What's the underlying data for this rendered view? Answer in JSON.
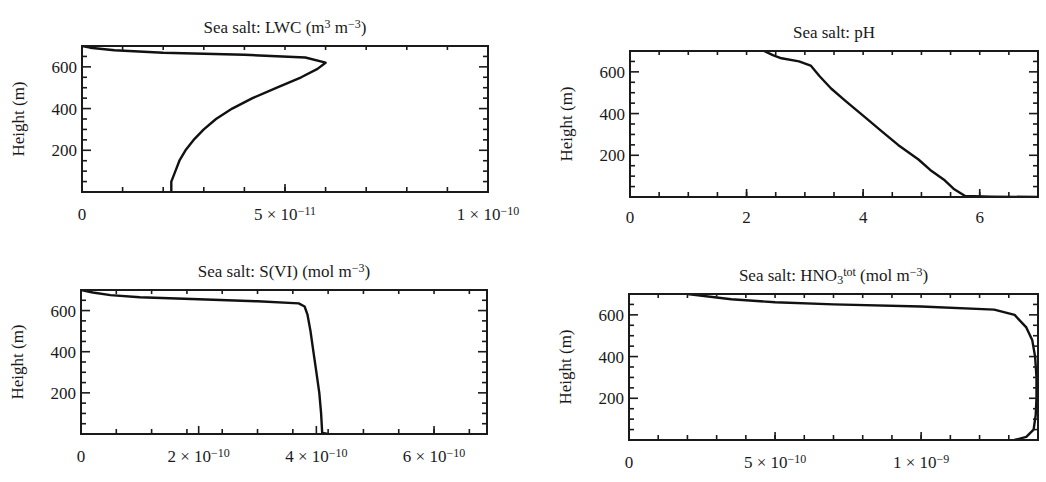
{
  "figure": {
    "panels": [
      {
        "id": "lwc",
        "title_parts": [
          [
            "Sea salt: LWC (m",
            ""
          ],
          [
            "3",
            "sup"
          ],
          [
            " m",
            ""
          ],
          [
            "−3",
            "sup"
          ],
          [
            ")",
            ""
          ]
        ],
        "title_text": "Sea salt: LWC (m3 m−3)",
        "ylabel": "Height (m)",
        "box": {
          "x0": 82,
          "y0": 46,
          "x1": 488,
          "y1": 192
        },
        "xlim": [
          0,
          1e-10
        ],
        "ylim": [
          0,
          700
        ],
        "xticks_major": [
          {
            "value": 0,
            "label": [
              [
                "0",
                ""
              ]
            ]
          },
          {
            "value": 5e-11,
            "label": [
              [
                "5 × 10",
                ""
              ],
              [
                "−11",
                "sup"
              ]
            ]
          },
          {
            "value": 1e-10,
            "label": [
              [
                "1 × 10",
                ""
              ],
              [
                "−10",
                "sup"
              ]
            ]
          }
        ],
        "xticks_minor_step": 1e-11,
        "yticks_major": [
          200,
          400,
          600
        ],
        "yticks_minor_step": 50,
        "tick_label_offset": 28
      },
      {
        "id": "ph",
        "title_parts": [
          [
            "Sea salt: pH",
            ""
          ]
        ],
        "title_text": "Sea salt: pH",
        "ylabel": "Height (m)",
        "box": {
          "x0": 630,
          "y0": 51,
          "x1": 1038,
          "y1": 197
        },
        "xlim": [
          0,
          7
        ],
        "ylim": [
          0,
          700
        ],
        "xticks_major": [
          {
            "value": 0,
            "label": [
              [
                "0",
                ""
              ]
            ]
          },
          {
            "value": 2,
            "label": [
              [
                "2",
                ""
              ]
            ]
          },
          {
            "value": 4,
            "label": [
              [
                "4",
                ""
              ]
            ]
          },
          {
            "value": 6,
            "label": [
              [
                "6",
                ""
              ]
            ]
          }
        ],
        "xticks_minor_step": 0.5,
        "yticks_major": [
          200,
          400,
          600
        ],
        "yticks_minor_step": 50,
        "tick_label_offset": 26
      },
      {
        "id": "svi",
        "title_parts": [
          [
            "Sea salt: S(VI) (mol m",
            ""
          ],
          [
            "−3",
            "sup"
          ],
          [
            ")",
            ""
          ]
        ],
        "title_text": "Sea salt: S(VI) (mol m−3)",
        "ylabel": "Height (m)",
        "box": {
          "x0": 81,
          "y0": 290,
          "x1": 487,
          "y1": 434
        },
        "xlim": [
          0,
          6.9e-10
        ],
        "ylim": [
          0,
          700
        ],
        "xticks_major": [
          {
            "value": 0,
            "label": [
              [
                "0",
                ""
              ]
            ]
          },
          {
            "value": 2e-10,
            "label": [
              [
                "2 × 10",
                ""
              ],
              [
                "−10",
                "sup"
              ]
            ]
          },
          {
            "value": 4e-10,
            "label": [
              [
                "4 × 10",
                ""
              ],
              [
                "−10",
                "sup"
              ]
            ]
          },
          {
            "value": 6e-10,
            "label": [
              [
                "6 × 10",
                ""
              ],
              [
                "−10",
                "sup"
              ]
            ]
          }
        ],
        "xticks_minor_step": 6e-11,
        "yticks_major": [
          200,
          400,
          600
        ],
        "yticks_minor_step": 50,
        "tick_label_offset": 28
      },
      {
        "id": "hno3",
        "title_parts": [
          [
            "Sea salt: HNO",
            ""
          ],
          [
            "3",
            "sub"
          ],
          [
            "tot",
            "supshift"
          ],
          [
            " (mol m",
            ""
          ],
          [
            "−3",
            "sup"
          ],
          [
            ")",
            ""
          ]
        ],
        "title_text": "Sea salt: HNO3tot (mol m−3)",
        "ylabel": "Height (m)",
        "box": {
          "x0": 629,
          "y0": 294,
          "x1": 1038,
          "y1": 440
        },
        "xlim": [
          0,
          1.4e-09
        ],
        "ylim": [
          0,
          700
        ],
        "xticks_major": [
          {
            "value": 0,
            "label": [
              [
                "0",
                ""
              ]
            ]
          },
          {
            "value": 5e-10,
            "label": [
              [
                "5 × 10",
                ""
              ],
              [
                "−10",
                "sup"
              ]
            ]
          },
          {
            "value": 1e-09,
            "label": [
              [
                "1 × 10",
                ""
              ],
              [
                "−9",
                "sup"
              ]
            ]
          }
        ],
        "xticks_minor_step": 1e-10,
        "yticks_major": [
          200,
          400,
          600
        ],
        "yticks_minor_step": 50,
        "tick_label_offset": 28
      }
    ]
  },
  "chart_data": [
    {
      "type": "line",
      "title": "Sea salt: LWC (m^3 m^-3)",
      "xlabel": "",
      "ylabel": "Height (m)",
      "xlim": [
        0,
        1e-10
      ],
      "ylim": [
        0,
        700
      ],
      "xticks": [
        "0",
        "5 × 10^-11",
        "1 × 10^-10"
      ],
      "yticks": [
        "200",
        "400",
        "600"
      ],
      "grid": false,
      "series": [
        {
          "name": "LWC",
          "x": [
            2.2e-11,
            2.2e-11,
            2.3e-11,
            2.4e-11,
            2.55e-11,
            2.75e-11,
            3e-11,
            3.3e-11,
            3.7e-11,
            4.2e-11,
            4.8e-11,
            5.4e-11,
            5.8e-11,
            6e-11,
            5.5e-11,
            4e-11,
            2e-11,
            8e-12,
            2e-12,
            0
          ],
          "y": [
            0,
            50,
            100,
            150,
            200,
            250,
            300,
            350,
            400,
            450,
            500,
            550,
            590,
            620,
            645,
            658,
            668,
            680,
            692,
            700
          ]
        }
      ]
    },
    {
      "type": "line",
      "title": "Sea salt: pH",
      "xlabel": "",
      "ylabel": "Height (m)",
      "xlim": [
        0,
        7
      ],
      "ylim": [
        0,
        700
      ],
      "xticks": [
        "0",
        "2",
        "4",
        "6"
      ],
      "yticks": [
        "200",
        "400",
        "600"
      ],
      "grid": false,
      "series": [
        {
          "name": "pH",
          "x": [
            7.0,
            6.2,
            5.75,
            5.55,
            5.4,
            5.15,
            4.95,
            4.6,
            4.3,
            4.0,
            3.7,
            3.45,
            3.25,
            3.1,
            2.9,
            2.6,
            2.45,
            2.3
          ],
          "y": [
            0,
            2,
            5,
            40,
            80,
            130,
            180,
            250,
            320,
            390,
            460,
            520,
            580,
            630,
            650,
            665,
            680,
            700
          ]
        }
      ]
    },
    {
      "type": "line",
      "title": "Sea salt: S(VI) (mol m^-3)",
      "xlabel": "",
      "ylabel": "Height (m)",
      "xlim": [
        0,
        6.9e-10
      ],
      "ylim": [
        0,
        700
      ],
      "xticks": [
        "0",
        "2 × 10^-10",
        "4 × 10^-10",
        "6 × 10^-10"
      ],
      "yticks": [
        "200",
        "400",
        "600"
      ],
      "grid": false,
      "series": [
        {
          "name": "S(VI)",
          "x": [
            4.2e-10,
            4.1e-10,
            4.08e-10,
            4.05e-10,
            4e-10,
            3.95e-10,
            3.9e-10,
            3.85e-10,
            3.8e-10,
            3.7e-10,
            3e-10,
            2e-10,
            1e-10,
            5e-11,
            2e-11,
            0
          ],
          "y": [
            0,
            5,
            100,
            200,
            300,
            400,
            500,
            580,
            620,
            635,
            645,
            655,
            665,
            675,
            688,
            700
          ]
        }
      ]
    },
    {
      "type": "line",
      "title": "Sea salt: HNO3^tot (mol m^-3)",
      "xlabel": "",
      "ylabel": "Height (m)",
      "xlim": [
        0,
        1.4e-09
      ],
      "ylim": [
        0,
        700
      ],
      "xticks": [
        "0",
        "5 × 10^-10",
        "1 × 10^-9"
      ],
      "yticks": [
        "200",
        "400",
        "600"
      ],
      "grid": false,
      "series": [
        {
          "name": "HNO3tot",
          "x": [
            1.32e-09,
            1.36e-09,
            1.385e-09,
            1.392e-09,
            1.395e-09,
            1.395e-09,
            1.39e-09,
            1.38e-09,
            1.36e-09,
            1.32e-09,
            1.25e-09,
            1e-09,
            7e-10,
            5e-10,
            3.5e-10,
            2e-10
          ],
          "y": [
            0,
            15,
            50,
            120,
            200,
            300,
            400,
            480,
            540,
            600,
            625,
            640,
            650,
            660,
            675,
            700
          ]
        }
      ]
    }
  ]
}
